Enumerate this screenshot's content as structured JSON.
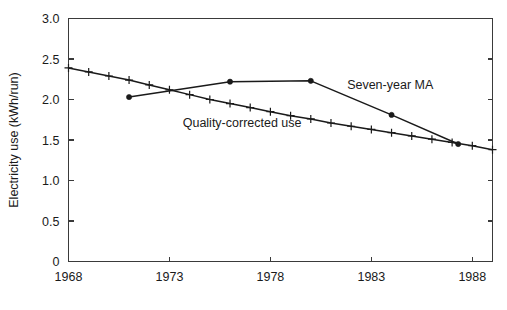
{
  "figure": {
    "background_color": "#ffffff",
    "line_color": "#1a1a1a",
    "axis_color": "#3a3a3a"
  },
  "chart_data": {
    "type": "line",
    "title": "",
    "xlabel": "",
    "ylabel": "Electricity use (kWh/run)",
    "xlim": [
      1968,
      1989
    ],
    "ylim": [
      0,
      3.0
    ],
    "grid": false,
    "legend_position": "inline-annotations",
    "x_ticks": [
      1968,
      1973,
      1978,
      1983,
      1988
    ],
    "x_tick_labels": [
      "1968",
      "1973",
      "1978",
      "1983",
      "1988"
    ],
    "y_ticks": [
      0,
      0.5,
      1.0,
      1.5,
      2.0,
      2.5,
      3.0
    ],
    "y_tick_labels": [
      "0",
      "0.5",
      "1.0",
      "1.5",
      "2.0",
      "2.5",
      "3.0"
    ],
    "series": [
      {
        "name": "Seven-year MA",
        "marker": "filled-circle",
        "annotation": "Seven-year MA",
        "annotation_x": 1981.8,
        "annotation_y": 2.13,
        "x": [
          1971.0,
          1976.0,
          1980.0,
          1984.0,
          1987.3
        ],
        "values": [
          2.03,
          2.22,
          2.23,
          1.81,
          1.45
        ]
      },
      {
        "name": "Quality-corrected use",
        "marker": "plus",
        "annotation": "Quality-corrected use",
        "annotation_x": 1976.6,
        "annotation_y": 1.66,
        "x": [
          1968,
          1969,
          1970,
          1971,
          1972,
          1973,
          1974,
          1975,
          1976,
          1977,
          1978,
          1979,
          1980,
          1981,
          1982,
          1983,
          1984,
          1985,
          1986,
          1987,
          1988,
          1989
        ],
        "values": [
          2.39,
          2.34,
          2.29,
          2.24,
          2.18,
          2.12,
          2.06,
          2.0,
          1.95,
          1.9,
          1.85,
          1.8,
          1.76,
          1.71,
          1.67,
          1.63,
          1.59,
          1.55,
          1.51,
          1.47,
          1.43,
          1.38
        ]
      }
    ]
  },
  "axes": {
    "y_title": "Electricity use (kWh/run)"
  }
}
